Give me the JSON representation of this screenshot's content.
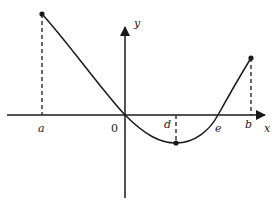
{
  "figure": {
    "axes": {
      "x_label": "x",
      "y_label": "y",
      "origin_label": "0"
    },
    "points": {
      "a": {
        "label": "a"
      },
      "d": {
        "label": "d"
      },
      "e": {
        "label": "e"
      },
      "b": {
        "label": "b"
      }
    },
    "colors": {
      "stroke": "#1a1a1a",
      "background": "#ffffff"
    }
  }
}
